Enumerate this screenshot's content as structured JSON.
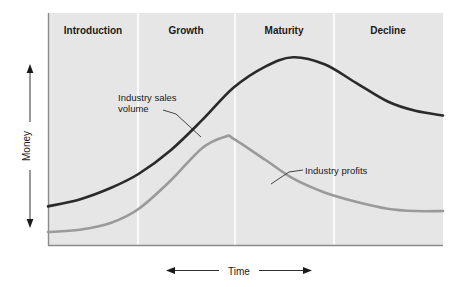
{
  "figure": {
    "background": "#ffffff",
    "plot_background": "#e6e6e6",
    "axis_color": "#8a8a8a",
    "divider_color": "#ffffff"
  },
  "axes": {
    "y_label": "Money",
    "x_label": "Time",
    "y_arrow": "double-headed-vertical",
    "x_arrow": "double-headed-horizontal"
  },
  "chart_data": {
    "type": "line",
    "title": "",
    "xlabel": "Time",
    "ylabel": "Money",
    "xlim": [
      0,
      100
    ],
    "ylim": [
      0,
      100
    ],
    "grid": false,
    "legend_position": "inline-annotations",
    "categories": [
      "Introduction",
      "Growth",
      "Maturity",
      "Decline"
    ],
    "stage_boundaries": [
      0,
      23,
      47,
      72,
      100
    ],
    "series": [
      {
        "name": "Industry sales volume",
        "color": "#2a2a2a",
        "stroke_width": 2.6,
        "x": [
          0,
          8,
          16,
          23,
          31,
          39,
          47,
          55,
          62,
          70,
          78,
          86,
          93,
          100
        ],
        "values": [
          17,
          20,
          25,
          31,
          41,
          54,
          68,
          77,
          81,
          78,
          70,
          62,
          58,
          56
        ]
      },
      {
        "name": "Industry profits",
        "color": "#9a9a9a",
        "stroke_width": 2.6,
        "x": [
          0,
          8,
          16,
          23,
          31,
          39,
          45,
          47,
          55,
          62,
          70,
          78,
          86,
          93,
          100
        ],
        "values": [
          6,
          7,
          10,
          16,
          28,
          42,
          47,
          46,
          37,
          29,
          23,
          19,
          16,
          15,
          15
        ]
      }
    ],
    "annotations": [
      {
        "id": "sales-annotation",
        "text_lines": [
          "Industry sales",
          "volume"
        ],
        "text_x": 118,
        "text_y": 101,
        "line_height": 11,
        "leader_path": "M 163 114 L 175 117 L 200 137"
      },
      {
        "id": "profits-annotation",
        "text_lines": [
          "Industry profits"
        ],
        "text_x": 303,
        "text_y": 173,
        "line_height": 11,
        "leader_path": "M 300 170 L 288 174 L 272 184"
      }
    ]
  },
  "stages": [
    {
      "label": "Introduction",
      "center_x": 93
    },
    {
      "label": "Growth",
      "center_x": 186
    },
    {
      "label": "Maturity",
      "center_x": 284
    },
    {
      "label": "Decline",
      "center_x": 388
    }
  ]
}
